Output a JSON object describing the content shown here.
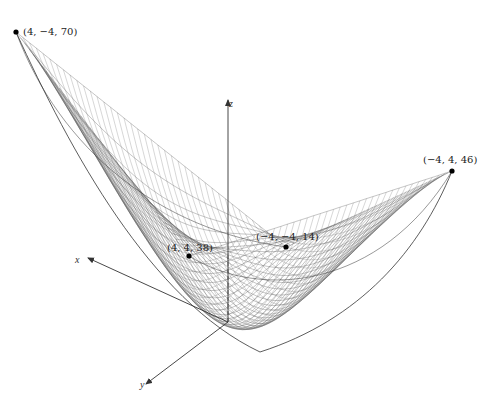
{
  "figure": {
    "type": "3d-surface-wireframe",
    "axes": {
      "x_label": "x",
      "y_label": "y",
      "z_label": "z"
    },
    "points": [
      {
        "label": "(4,  −4, 70)",
        "x": 4,
        "y": -4,
        "z": 70,
        "px": [
          16,
          32
        ]
      },
      {
        "label": "(−4, 4, 46)",
        "x": -4,
        "y": 4,
        "z": 46,
        "px": [
          452,
          171
        ]
      },
      {
        "label": "(−4,  −4, 14)",
        "x": -4,
        "y": -4,
        "z": 14,
        "px": [
          286,
          247
        ]
      },
      {
        "label": "(4, 4, 38)",
        "x": 4,
        "y": 4,
        "z": 38,
        "px": [
          189,
          256
        ]
      }
    ],
    "colors": {
      "mesh": "#555555",
      "axes": "#333333",
      "points": "#000000",
      "background": "#ffffff"
    }
  }
}
